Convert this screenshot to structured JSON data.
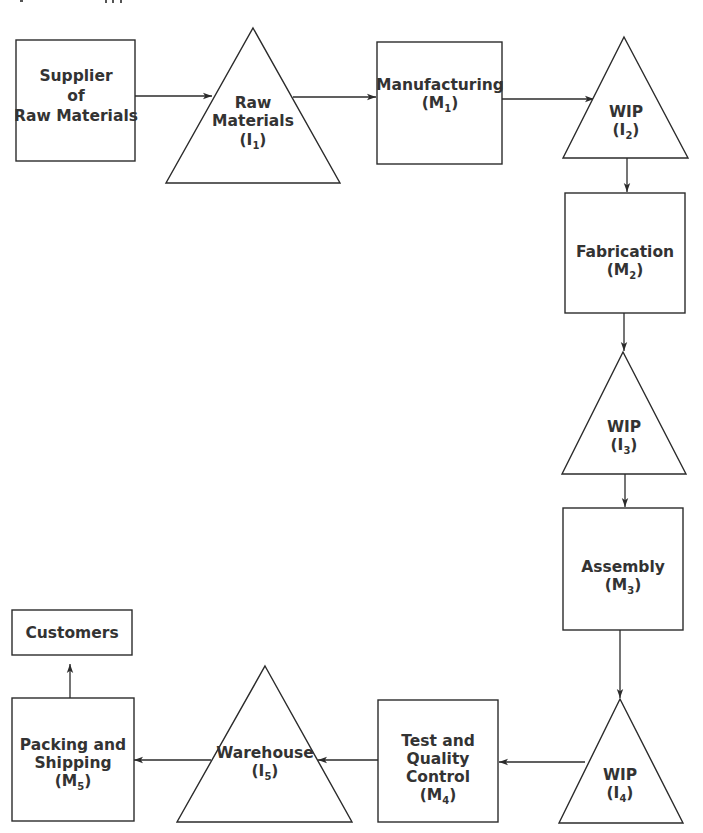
{
  "diagram": {
    "type": "supply-chain-flow",
    "colors": {
      "stroke": "#2b2b2b",
      "text": "#333333",
      "background": "#ffffff"
    },
    "nodes": [
      {
        "id": "supplier",
        "shape": "box",
        "lines": [
          "Supplier",
          "of",
          "Raw Materials"
        ],
        "subscript": null
      },
      {
        "id": "raw-materials",
        "shape": "triangle",
        "lines": [
          "Raw",
          "Materials"
        ],
        "code_prefix": "(I",
        "code_sub": "1",
        "code_suffix": ")"
      },
      {
        "id": "manufacturing",
        "shape": "box",
        "lines": [
          "Manufacturing"
        ],
        "code_prefix": "(M",
        "code_sub": "1",
        "code_suffix": ")"
      },
      {
        "id": "wip-2",
        "shape": "triangle",
        "lines": [
          "WIP"
        ],
        "code_prefix": "(I",
        "code_sub": "2",
        "code_suffix": ")"
      },
      {
        "id": "fabrication",
        "shape": "box",
        "lines": [
          "Fabrication"
        ],
        "code_prefix": "(M",
        "code_sub": "2",
        "code_suffix": ")"
      },
      {
        "id": "wip-3",
        "shape": "triangle",
        "lines": [
          "WIP"
        ],
        "code_prefix": "(I",
        "code_sub": "3",
        "code_suffix": ")"
      },
      {
        "id": "assembly",
        "shape": "box",
        "lines": [
          "Assembly"
        ],
        "code_prefix": "(M",
        "code_sub": "3",
        "code_suffix": ")"
      },
      {
        "id": "wip-4",
        "shape": "triangle",
        "lines": [
          "WIP"
        ],
        "code_prefix": "(I",
        "code_sub": "4",
        "code_suffix": ")"
      },
      {
        "id": "test-qc",
        "shape": "box",
        "lines": [
          "Test and",
          "Quality",
          "Control"
        ],
        "code_prefix": "(M",
        "code_sub": "4",
        "code_suffix": ")"
      },
      {
        "id": "warehouse",
        "shape": "triangle",
        "lines": [
          "Warehouse"
        ],
        "code_prefix": "(I",
        "code_sub": "5",
        "code_suffix": ")"
      },
      {
        "id": "packing-shipping",
        "shape": "box",
        "lines": [
          "Packing and",
          "Shipping"
        ],
        "code_prefix": "(M",
        "code_sub": "5",
        "code_suffix": ")"
      },
      {
        "id": "customers",
        "shape": "box",
        "lines": [
          "Customers"
        ],
        "subscript": null
      }
    ],
    "edges": [
      {
        "from": "supplier",
        "to": "raw-materials"
      },
      {
        "from": "raw-materials",
        "to": "manufacturing"
      },
      {
        "from": "manufacturing",
        "to": "wip-2"
      },
      {
        "from": "wip-2",
        "to": "fabrication"
      },
      {
        "from": "fabrication",
        "to": "wip-3"
      },
      {
        "from": "wip-3",
        "to": "assembly"
      },
      {
        "from": "assembly",
        "to": "wip-4"
      },
      {
        "from": "wip-4",
        "to": "test-qc"
      },
      {
        "from": "test-qc",
        "to": "warehouse"
      },
      {
        "from": "warehouse",
        "to": "packing-shipping"
      },
      {
        "from": "packing-shipping",
        "to": "customers"
      }
    ]
  }
}
